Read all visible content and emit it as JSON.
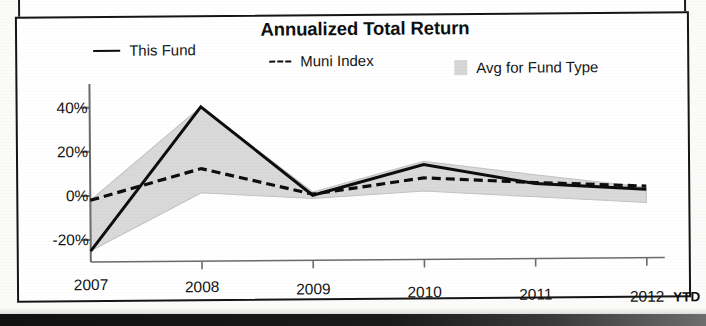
{
  "chart_data": {
    "type": "line",
    "title": "Annualized Total Return",
    "xlabel": "",
    "ylabel": "",
    "x": [
      "2007",
      "2008",
      "2009",
      "2010",
      "2011",
      "2012"
    ],
    "x_suffix_label": "YTD",
    "ylim": [
      -30,
      48
    ],
    "ytick_values": [
      40,
      20,
      0,
      -20
    ],
    "ytick_labels": [
      "40%",
      "20%",
      "0%",
      "-20%"
    ],
    "grid": false,
    "legend_position": "top",
    "series": [
      {
        "name": "This Fund",
        "style": "solid",
        "color": "#0d0d0d",
        "values": [
          -25,
          40,
          -0.5,
          13,
          4,
          1
        ]
      },
      {
        "name": "Muni Index",
        "style": "dashed",
        "color": "#0d0d0d",
        "values": [
          -2,
          12,
          0,
          7,
          4.5,
          2.5
        ]
      },
      {
        "name": "Avg for Fund Type",
        "style": "area",
        "color": "#d9d9d9",
        "upper_values": [
          -2,
          40,
          1,
          14.5,
          8,
          2
        ],
        "lower_values": [
          -25,
          1,
          -2,
          1,
          -2,
          -5
        ]
      }
    ]
  },
  "chart": {
    "title": "Annualized Total Return",
    "legend": [
      {
        "label": "This Fund",
        "marker": "solid-line-swatch"
      },
      {
        "label": "Muni Index",
        "marker": "dashed-line-swatch"
      },
      {
        "label": "Avg for Fund Type",
        "marker": "area-swatch"
      }
    ],
    "y_axis": {
      "labels": [
        "40%",
        "20%",
        "0%",
        "-20%"
      ]
    },
    "x_axis": {
      "labels": [
        "2007",
        "2008",
        "2009",
        "2010",
        "2011",
        "2012"
      ],
      "suffix": "YTD"
    },
    "colors": {
      "fund_line": "#0d0d0d",
      "index_line": "#0d0d0d",
      "avg_area": "#d9d9d9",
      "axis": "#6b6b6b",
      "border": "#151515"
    }
  }
}
